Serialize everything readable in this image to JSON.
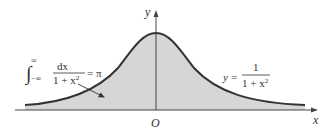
{
  "figure": {
    "type": "function-graph",
    "function_label": {
      "lhs": "y",
      "eq": "=",
      "numerator": "1",
      "denominator": "1 + x",
      "denominator_exp": "2"
    },
    "integral_label": {
      "upper_limit": "∞",
      "lower_limit": "−∞",
      "numerator": "dx",
      "denominator": "1 + x",
      "denominator_exp": "2",
      "eq": "=",
      "value": "π"
    },
    "axes": {
      "x_label": "x",
      "y_label": "y",
      "origin_label": "O"
    },
    "colors": {
      "curve": "#333333",
      "fill": "#d6d6d6",
      "axis": "#444444",
      "text": "#333333"
    }
  }
}
